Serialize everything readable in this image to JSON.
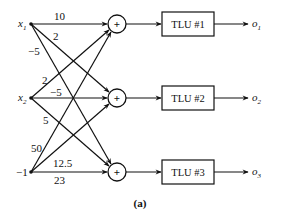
{
  "diagram": {
    "caption": "(a)",
    "inputs": [
      {
        "id": "x1",
        "label": "x",
        "sub": "1"
      },
      {
        "id": "x2",
        "label": "x",
        "sub": "2"
      },
      {
        "id": "bias",
        "label": "−1",
        "sub": ""
      }
    ],
    "summers": [
      {
        "id": "s1",
        "symbol": "+"
      },
      {
        "id": "s2",
        "symbol": "+"
      },
      {
        "id": "s3",
        "symbol": "+"
      }
    ],
    "tlus": [
      {
        "id": "tlu1",
        "label": "TLU #1"
      },
      {
        "id": "tlu2",
        "label": "TLU #2"
      },
      {
        "id": "tlu3",
        "label": "TLU #3"
      }
    ],
    "outputs": [
      {
        "id": "o1",
        "label": "o",
        "sub": "1"
      },
      {
        "id": "o2",
        "label": "o",
        "sub": "2"
      },
      {
        "id": "o3",
        "label": "o",
        "sub": "3"
      }
    ],
    "weights": {
      "x1_s1": "10",
      "x1_s2": "2",
      "x1_s3": "−5",
      "x2_s1": "2",
      "x2_s2": "−5",
      "x2_s3": "5",
      "bias_s1": "50",
      "bias_s2": "12.5",
      "bias_s3": "23"
    },
    "edges": [
      {
        "from": "x1",
        "to": "s1",
        "weight": "10"
      },
      {
        "from": "x1",
        "to": "s2",
        "weight": "2"
      },
      {
        "from": "x1",
        "to": "s3",
        "weight": "−5"
      },
      {
        "from": "x2",
        "to": "s1",
        "weight": "2"
      },
      {
        "from": "x2",
        "to": "s2",
        "weight": "−5"
      },
      {
        "from": "x2",
        "to": "s3",
        "weight": "5"
      },
      {
        "from": "bias",
        "to": "s1",
        "weight": "50"
      },
      {
        "from": "bias",
        "to": "s2",
        "weight": "12.5"
      },
      {
        "from": "bias",
        "to": "s3",
        "weight": "23"
      }
    ]
  }
}
